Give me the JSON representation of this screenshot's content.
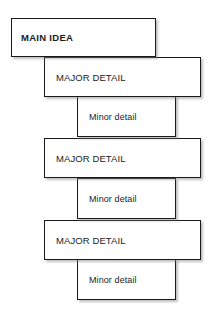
{
  "diagram": {
    "type": "hierarchical-outline-cascade",
    "background_color": "#ffffff",
    "border_color": "#1a1a1a",
    "text_color": "#1c1c1c",
    "nodes": [
      {
        "level": 0,
        "label": "MAIN IDEA",
        "emphasis": "bold"
      },
      {
        "level": 1,
        "label": "MAJOR DETAIL",
        "emphasis": "normal"
      },
      {
        "level": 2,
        "label": "Minor detail",
        "emphasis": "normal"
      },
      {
        "level": 1,
        "label": "MAJOR DETAIL",
        "emphasis": "normal"
      },
      {
        "level": 2,
        "label": "Minor detail",
        "emphasis": "normal"
      },
      {
        "level": 1,
        "label": "MAJOR DETAIL",
        "emphasis": "normal"
      },
      {
        "level": 2,
        "label": "Minor detail",
        "emphasis": "normal"
      }
    ]
  }
}
